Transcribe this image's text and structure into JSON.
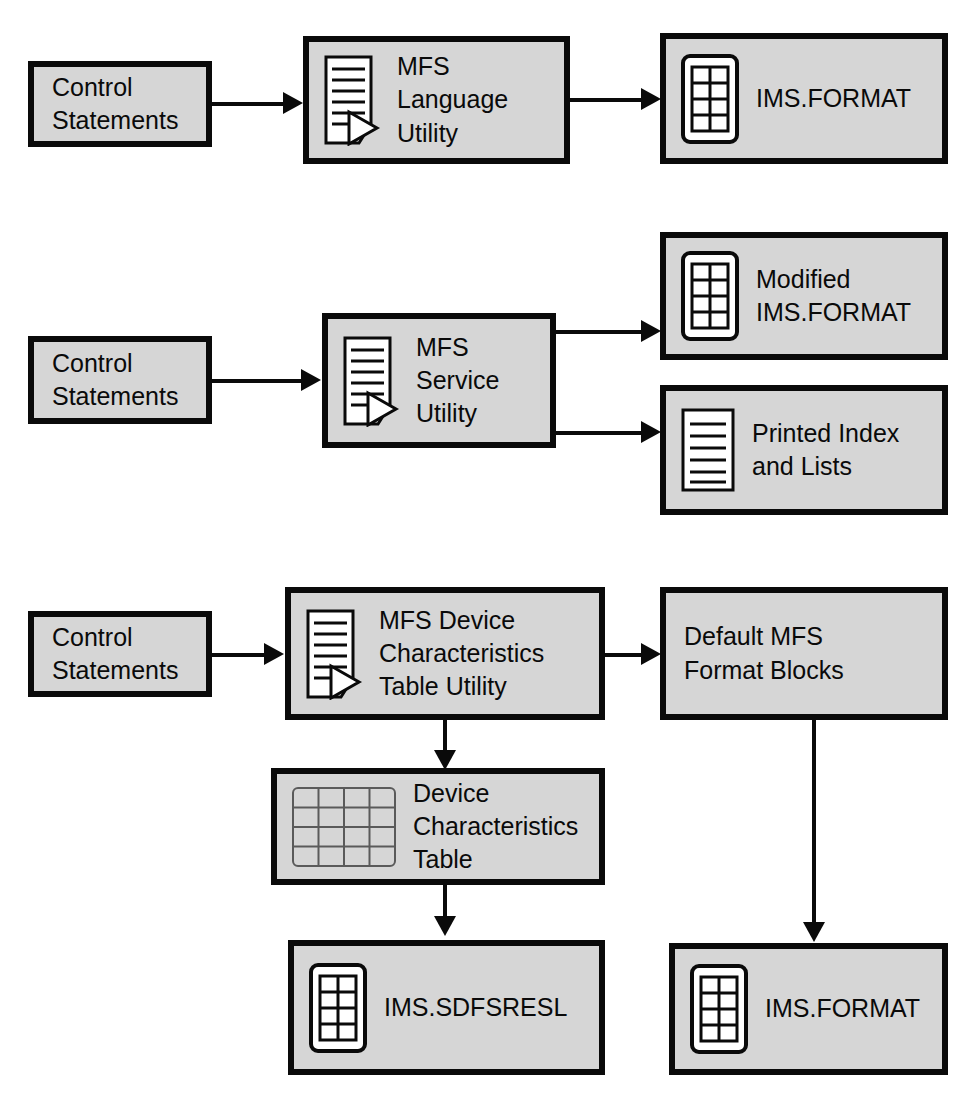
{
  "diagram": {
    "colors": {
      "box_fill": "#d6d6d6",
      "outline": "#0a0a0a",
      "page": "#ffffff"
    },
    "nodes": [
      {
        "id": "control-statements-1",
        "label": "Control\nStatements",
        "icon": "none"
      },
      {
        "id": "mfs-language-utility",
        "label": "MFS\nLanguage\nUtility",
        "icon": "document-process-icon"
      },
      {
        "id": "ims-format-1",
        "label": "IMS.FORMAT",
        "icon": "dataset-icon"
      },
      {
        "id": "control-statements-2",
        "label": "Control\nStatements",
        "icon": "none"
      },
      {
        "id": "mfs-service-utility",
        "label": "MFS\nService\nUtility",
        "icon": "document-process-icon"
      },
      {
        "id": "modified-ims-format",
        "label": "Modified\nIMS.FORMAT",
        "icon": "dataset-icon"
      },
      {
        "id": "printed-index-and-lists",
        "label": "Printed Index\nand Lists",
        "icon": "document-icon"
      },
      {
        "id": "control-statements-3",
        "label": "Control\nStatements",
        "icon": "none"
      },
      {
        "id": "mfs-device-characteristics-table-utility",
        "label": "MFS Device\nCharacteristics\nTable Utility",
        "icon": "document-process-icon"
      },
      {
        "id": "default-mfs-format-blocks",
        "label": "Default MFS\nFormat Blocks",
        "icon": "none"
      },
      {
        "id": "device-characteristics-table",
        "label": "Device\nCharacteristics\nTable",
        "icon": "table-grid-icon"
      },
      {
        "id": "ims-sdfsresl",
        "label": "IMS.SDFSRESL",
        "icon": "dataset-icon"
      },
      {
        "id": "ims-format-2",
        "label": "IMS.FORMAT",
        "icon": "dataset-icon"
      }
    ],
    "edges": [
      {
        "from": "control-statements-1",
        "to": "mfs-language-utility",
        "direction": "right"
      },
      {
        "from": "mfs-language-utility",
        "to": "ims-format-1",
        "direction": "right"
      },
      {
        "from": "control-statements-2",
        "to": "mfs-service-utility",
        "direction": "right"
      },
      {
        "from": "mfs-service-utility",
        "to": "modified-ims-format",
        "direction": "right"
      },
      {
        "from": "mfs-service-utility",
        "to": "printed-index-and-lists",
        "direction": "right"
      },
      {
        "from": "control-statements-3",
        "to": "mfs-device-characteristics-table-utility",
        "direction": "right"
      },
      {
        "from": "mfs-device-characteristics-table-utility",
        "to": "default-mfs-format-blocks",
        "direction": "right"
      },
      {
        "from": "mfs-device-characteristics-table-utility",
        "to": "device-characteristics-table",
        "direction": "down"
      },
      {
        "from": "device-characteristics-table",
        "to": "ims-sdfsresl",
        "direction": "down"
      },
      {
        "from": "default-mfs-format-blocks",
        "to": "ims-format-2",
        "direction": "down"
      }
    ]
  }
}
